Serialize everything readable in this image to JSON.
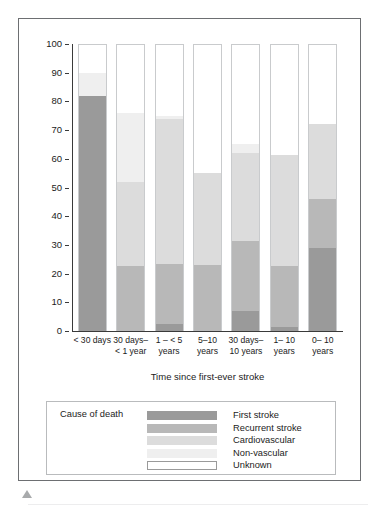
{
  "figure": {
    "triangle_marker": "triangle-up-marker"
  },
  "chart_data": {
    "type": "bar",
    "subtype": "stacked-bar-100-percent",
    "title": "",
    "xlabel": "Time since first-ever stroke",
    "ylabel": "Percentage",
    "ylim": [
      0,
      100
    ],
    "ytick_labels": [
      "100",
      "90",
      "80",
      "70",
      "60",
      "50",
      "40",
      "30",
      "20",
      "10",
      "0"
    ],
    "ytick_values": [
      100,
      90,
      80,
      70,
      60,
      50,
      40,
      30,
      20,
      10,
      0
    ],
    "grid": false,
    "legend_position": "below-plot",
    "legend_title": "Cause of death",
    "categories": [
      "< 30 days",
      "30 days–\n< 1 year",
      "1 – < 5\nyears",
      "5–10\nyears",
      "30 days–\n10 years",
      "1– 10\nyears",
      "0– 10\nyears"
    ],
    "category_lines": [
      [
        "< 30 days",
        ""
      ],
      [
        "30 days–",
        "< 1 year"
      ],
      [
        "1 – < 5",
        "years"
      ],
      [
        "5–10",
        "years"
      ],
      [
        "30 days–",
        "10 years"
      ],
      [
        "1– 10",
        "years"
      ],
      [
        "0– 10",
        "years"
      ]
    ],
    "series": [
      {
        "name": "First stroke",
        "color": "#9a9a9a",
        "values": [
          82,
          0,
          2.5,
          0,
          7,
          1.5,
          29
        ]
      },
      {
        "name": "Recurrent stroke",
        "color": "#b8b8b8",
        "values": [
          0,
          22.5,
          21,
          23,
          24.5,
          21,
          17
        ]
      },
      {
        "name": "Cardiovascular",
        "color": "#dcdcdc",
        "values": [
          0,
          29.5,
          50.5,
          32,
          30.5,
          39,
          26
        ]
      },
      {
        "name": "Non-vascular",
        "color": "#efefef",
        "values": [
          8,
          24,
          1,
          0,
          3,
          0,
          0
        ]
      },
      {
        "name": "Unknown",
        "color": "#ffffff",
        "values": [
          10,
          24,
          25,
          45,
          35,
          38.5,
          28
        ]
      }
    ],
    "cumulative_tops": [
      [
        82,
        82,
        82,
        90,
        100
      ],
      [
        0,
        22.5,
        52,
        76,
        100
      ],
      [
        2.5,
        23.5,
        74,
        75,
        100
      ],
      [
        0,
        23,
        55,
        55,
        100
      ],
      [
        7,
        31.5,
        62,
        65,
        100
      ],
      [
        1.5,
        22.5,
        61.5,
        61.5,
        100
      ],
      [
        29,
        46,
        72,
        72,
        100
      ]
    ]
  }
}
